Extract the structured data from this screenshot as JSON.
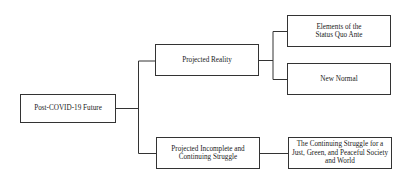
{
  "diagram": {
    "type": "tree",
    "root": {
      "label": "Post-COVID-19 Future"
    },
    "level1": [
      {
        "label": "Projected Reality"
      },
      {
        "label": "Projected Incomplete and Continuing Struggle"
      }
    ],
    "level2": [
      {
        "parent": "Projected Reality",
        "label": "Elements of the Status Quo Ante"
      },
      {
        "parent": "Projected Reality",
        "label": "New Normal"
      },
      {
        "parent": "Projected Incomplete and Continuing Struggle",
        "label": "The Continuing Struggle for a Just, Green, and Peaceful Society and World"
      }
    ],
    "colors": {
      "line": "#333333",
      "background": "#ffffff"
    }
  }
}
